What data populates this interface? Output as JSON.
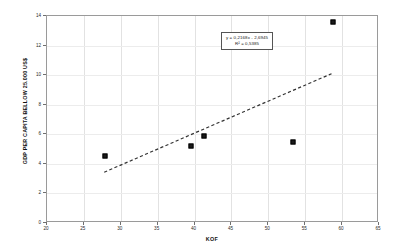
{
  "chart_data": {
    "type": "scatter",
    "title": "",
    "xlabel": "KOF",
    "ylabel": "GDP PER CAPITA BELLOW 25.000 US$",
    "xlim": [
      20,
      65
    ],
    "ylim": [
      0,
      14
    ],
    "xticks": [
      20,
      25,
      30,
      35,
      40,
      45,
      50,
      55,
      60,
      65
    ],
    "yticks": [
      0,
      2,
      4,
      6,
      8,
      10,
      12,
      14
    ],
    "grid": true,
    "legend": "none",
    "points": [
      {
        "x": 27.8,
        "y": 4.5
      },
      {
        "x": 39.5,
        "y": 5.2
      },
      {
        "x": 41.3,
        "y": 5.9
      },
      {
        "x": 53.3,
        "y": 5.45
      },
      {
        "x": 58.8,
        "y": 13.6
      }
    ],
    "trendline": {
      "style": "dashed",
      "slope": 0.2168,
      "intercept": -2.6945,
      "x_start": 27.8,
      "x_end": 58.8,
      "y_start": 3.33,
      "y_end": 10.06
    },
    "annotation": {
      "equation": "y = 0,2168x - 2,6945",
      "r_squared": "R² = 0,5385"
    }
  },
  "axes": {
    "x_title": "KOF",
    "y_title": "GDP PER CAPITA BELLOW 25.000 US$",
    "x_tick_labels": [
      "20",
      "25",
      "30",
      "35",
      "40",
      "45",
      "50",
      "55",
      "60",
      "65"
    ],
    "y_tick_labels": [
      "0",
      "2",
      "4",
      "6",
      "8",
      "10",
      "12",
      "14"
    ]
  },
  "colors": {
    "point": "#1a1a1a",
    "trendline": "#333333",
    "frame": "#9a9a9a",
    "gridline": "#e2e2e2",
    "background": "#ffffff"
  }
}
